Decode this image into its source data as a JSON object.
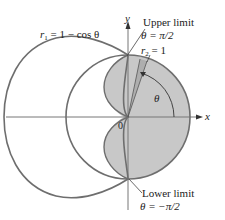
{
  "diagram": {
    "curves": {
      "r1": {
        "label_var": "r",
        "label_sub": "1",
        "label_rest": " = 1 − cos θ"
      },
      "r2": {
        "label_var": "r",
        "label_sub": "2",
        "label_rest": " = 1"
      }
    },
    "axes": {
      "x_label": "x",
      "y_label": "y",
      "origin_label": "0"
    },
    "angle_label": "θ",
    "upper_limit": {
      "title": "Upper limit",
      "value": "θ = π/2"
    },
    "lower_limit": {
      "title": "Lower limit",
      "value": "θ = −π/2"
    },
    "colors": {
      "stroke": "#6e6e6e",
      "shade": "#c8c8c8",
      "axis": "#777777",
      "text": "#222222"
    }
  }
}
